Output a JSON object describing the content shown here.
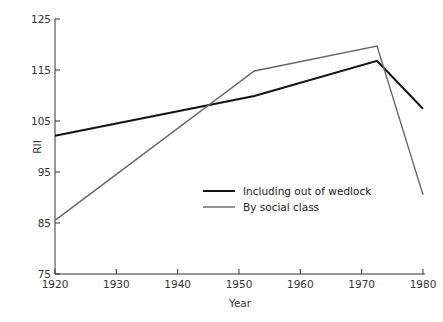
{
  "chart_data": {
    "type": "line",
    "title": "",
    "xlabel": "Year",
    "ylabel": "RII",
    "xlim": [
      1920,
      1980
    ],
    "ylim": [
      75,
      125
    ],
    "x_ticks": [
      1920,
      1930,
      1940,
      1950,
      1960,
      1970,
      1980
    ],
    "y_ticks": [
      75,
      85,
      95,
      105,
      115,
      125
    ],
    "grid": false,
    "legend_position": "center-right inside plot",
    "series": [
      {
        "name": "Including out of wedlock",
        "color": "#111111",
        "stroke_width": 2,
        "points": [
          [
            1920,
            102.1
          ],
          [
            1952.5,
            109.9
          ],
          [
            1972.5,
            116.8
          ],
          [
            1980,
            107.4
          ]
        ]
      },
      {
        "name": "By social class",
        "color": "#666666",
        "stroke_width": 1.4,
        "points": [
          [
            1920,
            85.5
          ],
          [
            1952.5,
            114.8
          ],
          [
            1972.5,
            119.7
          ],
          [
            1980,
            90.5
          ]
        ]
      }
    ]
  },
  "axes": {
    "x_title": "Year",
    "y_title": "RII",
    "x_tick_labels": [
      "1920",
      "1930",
      "1940",
      "1950",
      "1960",
      "1970",
      "1980"
    ],
    "y_tick_labels": [
      "75",
      "85",
      "95",
      "105",
      "115",
      "125"
    ]
  },
  "legend": {
    "items": [
      {
        "label": "Including out of wedlock",
        "color": "#111111"
      },
      {
        "label": "By social class",
        "color": "#666666"
      }
    ]
  }
}
